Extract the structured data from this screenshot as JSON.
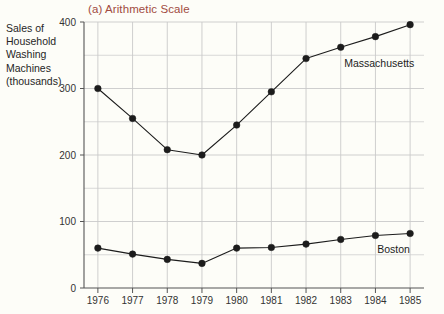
{
  "figure": {
    "title": "(a) Arithmetic Scale",
    "title_color": "#a14b42",
    "axis_label_lines": [
      "Sales of",
      "Household",
      "Washing",
      "Machines",
      "(thousands)"
    ],
    "background_color": "#fdfdf8"
  },
  "chart_data": {
    "type": "line",
    "title": "(a) Arithmetic Scale",
    "xlabel": "",
    "ylabel": "Sales of Household Washing Machines (thousands)",
    "x": [
      1976,
      1977,
      1978,
      1979,
      1980,
      1981,
      1982,
      1983,
      1984,
      1985
    ],
    "categories": [
      "1976",
      "1977",
      "1978",
      "1979",
      "1980",
      "1981",
      "1982",
      "1983",
      "1984",
      "1985"
    ],
    "series": [
      {
        "name": "Massachusetts",
        "color": "#1c1c1c",
        "values": [
          300,
          255,
          208,
          200,
          245,
          295,
          345,
          362,
          378,
          396
        ],
        "label_x": 1983.1,
        "label_y": 332
      },
      {
        "name": "Boston",
        "color": "#1c1c1c",
        "values": [
          60,
          51,
          43,
          37,
          60,
          61,
          66,
          73,
          79,
          82
        ],
        "label_x": 1984.05,
        "label_y": 52
      }
    ],
    "ylim": [
      0,
      400
    ],
    "yticks": [
      0,
      100,
      200,
      300,
      400
    ],
    "ytick_labels": [
      "0",
      "100",
      "200",
      "300",
      "400"
    ],
    "y_minor_step": 50,
    "xlim": [
      1975.6,
      1985.4
    ],
    "xticks": [
      1976,
      1977,
      1978,
      1979,
      1980,
      1981,
      1982,
      1983,
      1984,
      1985
    ],
    "xtick_labels": [
      "1976",
      "1977",
      "1978",
      "1979",
      "1980",
      "1981",
      "1982",
      "1983",
      "1984",
      "1985"
    ],
    "grid": true,
    "grid_color": "#c9c9c9",
    "axis_color": "#555555",
    "legend": "inline-labels",
    "marker": "filled-circle"
  }
}
